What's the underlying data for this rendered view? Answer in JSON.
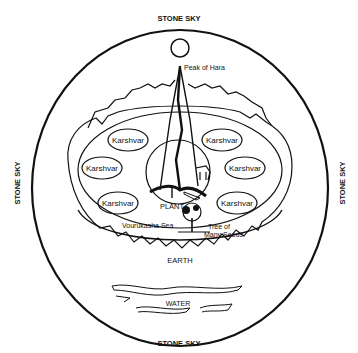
{
  "diagram": {
    "labels": {
      "top": "STONE SKY",
      "bottom": "STONE SKY",
      "left": "STONE SKY",
      "right": "STONE SKY",
      "peak": "Peak of Hara",
      "plant": "PLANT",
      "sea": "Vourukasha Sea",
      "tree_line1": "Tree of",
      "tree_line2": "Many Seeds",
      "earth": "EARTH",
      "water": "WATER"
    },
    "karshvars": [
      {
        "label": "Karshvar",
        "x": 128,
        "y": 140
      },
      {
        "label": "Karshvar",
        "x": 102,
        "y": 168
      },
      {
        "label": "Karshvar",
        "x": 118,
        "y": 203
      },
      {
        "label": "Karshvar",
        "x": 222,
        "y": 140
      },
      {
        "label": "Karshvar",
        "x": 245,
        "y": 168
      },
      {
        "label": "Karshvar",
        "x": 237,
        "y": 203
      }
    ],
    "colors": {
      "ink": "#111111",
      "background": "#ffffff"
    }
  }
}
